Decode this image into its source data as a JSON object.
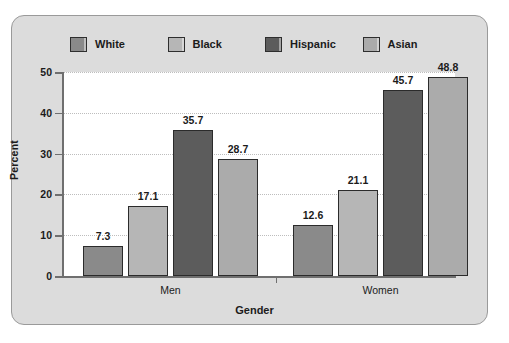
{
  "chart_data": {
    "type": "bar",
    "title": "",
    "subtitle": "",
    "xlabel": "Gender",
    "ylabel": "Percent",
    "categories": [
      "Men",
      "Women"
    ],
    "series": [
      {
        "name": "White",
        "color": "#8a8a8a",
        "values": [
          7.3,
          12.6
        ]
      },
      {
        "name": "Black",
        "color": "#b6b6b6",
        "values": [
          17.1,
          21.1
        ]
      },
      {
        "name": "Hispanic",
        "color": "#5c5c5c",
        "values": [
          35.7,
          45.7
        ]
      },
      {
        "name": "Asian",
        "color": "#ababab",
        "values": [
          28.7,
          48.8
        ]
      }
    ],
    "ylim": [
      0,
      50
    ],
    "yticks": [
      0,
      10,
      20,
      30,
      40,
      50
    ],
    "ytick_labels": [
      "0",
      "10",
      "20",
      "30",
      "40",
      "50"
    ],
    "grid": true,
    "grid_axis": "y",
    "grid_style": "dotted",
    "legend_position": "top",
    "value_labels": true,
    "plot_background": "#ffffff",
    "panel_background": "#dcdcdc",
    "axis_color": "#6f6f6f",
    "text_color": "#1b1b1b"
  },
  "legend": {
    "items": [
      {
        "label": "White"
      },
      {
        "label": "Black"
      },
      {
        "label": "Hispanic"
      },
      {
        "label": "Asian"
      }
    ]
  },
  "axes": {
    "y_title": "Percent",
    "x_title": "Gender",
    "y_tick_labels": [
      "50",
      "40",
      "30",
      "20",
      "10",
      "0"
    ],
    "x_group_labels": [
      "Men",
      "Women"
    ]
  },
  "bars": [
    {
      "group": "Men",
      "series": "White",
      "value": 7.3,
      "label": "7.3"
    },
    {
      "group": "Men",
      "series": "Black",
      "value": 17.1,
      "label": "17.1"
    },
    {
      "group": "Men",
      "series": "Hispanic",
      "value": 35.7,
      "label": "35.7"
    },
    {
      "group": "Men",
      "series": "Asian",
      "value": 28.7,
      "label": "28.7"
    },
    {
      "group": "Women",
      "series": "White",
      "value": 12.6,
      "label": "12.6"
    },
    {
      "group": "Women",
      "series": "Black",
      "value": 21.1,
      "label": "21.1"
    },
    {
      "group": "Women",
      "series": "Hispanic",
      "value": 45.7,
      "label": "45.7"
    },
    {
      "group": "Women",
      "series": "Asian",
      "value": 48.8,
      "label": "48.8"
    }
  ]
}
